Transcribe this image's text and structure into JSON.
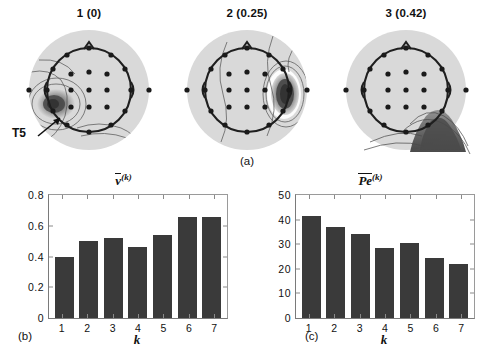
{
  "figure": {
    "caption_a": "(a)",
    "caption_b": "(b)",
    "caption_c": "(c)"
  },
  "topomaps": {
    "annotation": {
      "label": "T5",
      "icon": "arrow-icon"
    },
    "maps": [
      {
        "title": "1 (0)",
        "index": 1,
        "value": 0,
        "focus": "left-posterior-temporal",
        "name": "topomap-1"
      },
      {
        "title": "2 (0.25)",
        "index": 2,
        "value": 0.25,
        "focus": "right-temporal",
        "name": "topomap-2"
      },
      {
        "title": "3 (0.42)",
        "index": 3,
        "value": 0.42,
        "focus": "right-occipital-outside",
        "name": "topomap-3"
      }
    ]
  },
  "chart_data": [
    {
      "type": "bar",
      "name": "mean-v-by-k",
      "title": "v̄",
      "title_overline": "v",
      "title_superscript": "(k)",
      "categories": [
        "1",
        "2",
        "3",
        "4",
        "5",
        "6",
        "7"
      ],
      "values": [
        0.4,
        0.5,
        0.52,
        0.46,
        0.54,
        0.66,
        0.66
      ],
      "xlabel": "k",
      "ylabel": "",
      "ylim": [
        0,
        0.8
      ],
      "yticks": [
        0,
        0.2,
        0.4,
        0.6,
        0.8
      ],
      "ytick_labels": [
        "0",
        "0.2",
        "0.4",
        "0.6",
        "0.8"
      ],
      "grid": false,
      "bar_color": "#3a3a3a",
      "panel": "(b)"
    },
    {
      "type": "bar",
      "name": "mean-pe-by-k",
      "title": "Pē",
      "title_overline": "Pe",
      "title_superscript": "(k)",
      "categories": [
        "1",
        "2",
        "3",
        "4",
        "5",
        "6",
        "7"
      ],
      "values": [
        41.5,
        37.0,
        34.0,
        28.5,
        30.5,
        24.5,
        22.0
      ],
      "xlabel": "k",
      "ylabel": "",
      "ylim": [
        0,
        50
      ],
      "yticks": [
        0,
        10,
        20,
        30,
        40,
        50
      ],
      "ytick_labels": [
        "0",
        "10",
        "20",
        "30",
        "40",
        "50"
      ],
      "grid": false,
      "bar_color": "#3a3a3a",
      "panel": "(c)"
    }
  ],
  "colors": {
    "bar": "#3a3a3a",
    "axis": "#7a7a7a",
    "scalp": "#d8d8d8",
    "head_outline": "#1f1f1f",
    "electrode": "#1a1a1a",
    "text": "#111111"
  }
}
